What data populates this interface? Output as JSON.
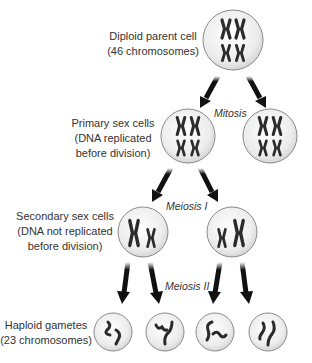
{
  "colors": {
    "cell_fill_center": "#ffffff",
    "cell_fill_edge": "#cfcfcf",
    "cell_stroke": "#8a8a8a",
    "chromosome": "#2b2b2b",
    "arrow": "#111111",
    "text": "#333333"
  },
  "stages": {
    "diploid": {
      "line1": "Diploid parent cell",
      "line2": "(46 chromosomes)"
    },
    "primary": {
      "line1": "Primary sex cells",
      "line2": "(DNA replicated",
      "line3": "before division)"
    },
    "secondary": {
      "line1": "Secondary sex cells",
      "line2": "(DNA not replicated",
      "line3": "before division)"
    },
    "haploid": {
      "line1": "Haploid gametes",
      "line2": "(23 chromosomes)"
    }
  },
  "processes": {
    "mitosis": "Mitosis",
    "meiosis1": "Meiosis I",
    "meiosis2": "Meiosis II"
  },
  "cells": [
    {
      "id": "parent",
      "cx": 233,
      "cy": 40,
      "r": 30,
      "chromosome_count_shown": 4
    },
    {
      "id": "primary",
      "cx": 188,
      "cy": 136,
      "r": 27,
      "chromosome_count_shown": 4
    },
    {
      "id": "mitosis-daughter",
      "cx": 270,
      "cy": 136,
      "r": 27,
      "chromosome_count_shown": 4
    },
    {
      "id": "secondary-left",
      "cx": 143,
      "cy": 232,
      "r": 25,
      "chromosome_count_shown": 2
    },
    {
      "id": "secondary-right",
      "cx": 232,
      "cy": 232,
      "r": 25,
      "chromosome_count_shown": 2
    },
    {
      "id": "gamete-1",
      "cx": 113,
      "cy": 332,
      "r": 19
    },
    {
      "id": "gamete-2",
      "cx": 165,
      "cy": 332,
      "r": 19
    },
    {
      "id": "gamete-3",
      "cx": 215,
      "cy": 332,
      "r": 19
    },
    {
      "id": "gamete-4",
      "cx": 268,
      "cy": 332,
      "r": 19
    }
  ]
}
